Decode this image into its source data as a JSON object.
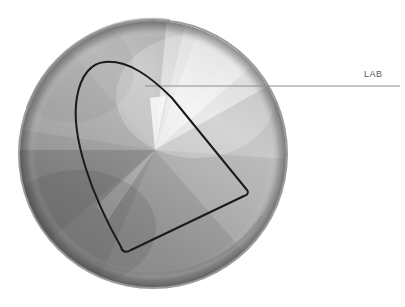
{
  "figure": {
    "background_color": "#ffffff",
    "width": 405,
    "height": 307
  },
  "disc": {
    "name": "metallic-disc",
    "center_x": 153,
    "center_y": 154,
    "radius": 135,
    "rim_color": "#9a9a9a",
    "gradient_type": "conic",
    "gradient_focus_x": 155,
    "gradient_focus_y": 150,
    "highlight_color": "#f2f2f2",
    "midtone_color": "#a8a8a8",
    "shadow_color": "#6e6e6e"
  },
  "gamut": {
    "name": "lab-gamut-outline",
    "stroke_color": "#1a1a1a",
    "stroke_width": 2,
    "fill": "none",
    "vertices": [
      {
        "label": "top",
        "x": 105,
        "y": 62
      },
      {
        "label": "right",
        "x": 247,
        "y": 190
      },
      {
        "label": "bottom",
        "x": 123,
        "y": 253
      }
    ]
  },
  "callout": {
    "name": "lab-callout",
    "label": "LAB",
    "leader_color": "#8c8c8c",
    "leader_width": 1,
    "leader_start_x": 145,
    "leader_start_y": 86,
    "leader_end_x": 400,
    "leader_end_y": 86,
    "label_x": 364,
    "label_y": 70
  }
}
